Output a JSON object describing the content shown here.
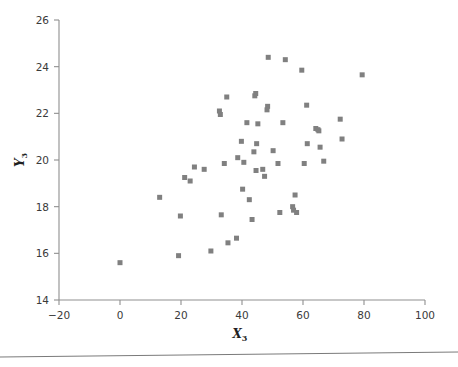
{
  "figure": {
    "kind": "scatter-plot",
    "background_color": "#ffffff",
    "marker_color": "#808080",
    "axis_color": "#8f8f8f",
    "tick_label_color": "#3a3a3a"
  },
  "axes": {
    "x_title": "X",
    "x_title_subscript": "3",
    "y_title": "Y",
    "y_title_subscript": "3",
    "x_ticks": [
      "−20",
      "0",
      "20",
      "40",
      "60",
      "80",
      "100"
    ],
    "y_ticks": [
      "14",
      "16",
      "18",
      "20",
      "22",
      "24",
      "26"
    ]
  },
  "chart_data": {
    "type": "scatter",
    "title": "",
    "xlabel": "X3",
    "ylabel": "Y3",
    "xlim": [
      -20,
      100
    ],
    "ylim": [
      14,
      26
    ],
    "xticks": [
      -20,
      0,
      20,
      40,
      60,
      80,
      100
    ],
    "yticks": [
      14,
      16,
      18,
      20,
      22,
      24,
      26
    ],
    "grid": false,
    "legend": false,
    "marker": "square",
    "marker_color": "#808080",
    "marker_size": 5,
    "n_points": 55,
    "points": [
      [
        0.0,
        15.6
      ],
      [
        13.0,
        18.4
      ],
      [
        19.2,
        15.9
      ],
      [
        19.8,
        17.6
      ],
      [
        21.2,
        19.25
      ],
      [
        23.0,
        19.1
      ],
      [
        24.4,
        19.7
      ],
      [
        27.6,
        19.6
      ],
      [
        29.8,
        16.1
      ],
      [
        32.6,
        22.1
      ],
      [
        32.9,
        21.95
      ],
      [
        33.2,
        17.65
      ],
      [
        34.2,
        19.85
      ],
      [
        35.0,
        22.7
      ],
      [
        35.4,
        16.45
      ],
      [
        38.2,
        16.65
      ],
      [
        39.8,
        20.8
      ],
      [
        40.2,
        18.75
      ],
      [
        40.6,
        19.9
      ],
      [
        41.6,
        21.6
      ],
      [
        42.4,
        18.3
      ],
      [
        43.3,
        17.45
      ],
      [
        43.9,
        20.35
      ],
      [
        44.2,
        22.75
      ],
      [
        44.5,
        22.85
      ],
      [
        44.6,
        19.55
      ],
      [
        44.8,
        20.7
      ],
      [
        46.8,
        19.6
      ],
      [
        47.4,
        19.3
      ],
      [
        48.2,
        22.15
      ],
      [
        48.4,
        22.3
      ],
      [
        48.6,
        24.4
      ],
      [
        51.8,
        19.85
      ],
      [
        52.4,
        17.75
      ],
      [
        53.4,
        21.6
      ],
      [
        54.2,
        24.3
      ],
      [
        56.6,
        18.0
      ],
      [
        56.9,
        17.85
      ],
      [
        57.4,
        18.5
      ],
      [
        57.9,
        17.75
      ],
      [
        59.6,
        23.85
      ],
      [
        60.4,
        19.85
      ],
      [
        61.2,
        22.35
      ],
      [
        61.4,
        20.7
      ],
      [
        64.2,
        21.35
      ],
      [
        64.9,
        21.3
      ],
      [
        65.2,
        21.25
      ],
      [
        65.6,
        20.55
      ],
      [
        66.8,
        19.95
      ],
      [
        72.2,
        21.75
      ],
      [
        72.8,
        20.9
      ],
      [
        79.4,
        23.65
      ],
      [
        45.2,
        21.55
      ],
      [
        38.6,
        20.1
      ],
      [
        50.2,
        20.4
      ]
    ]
  },
  "footer": {
    "rule_present": true
  }
}
